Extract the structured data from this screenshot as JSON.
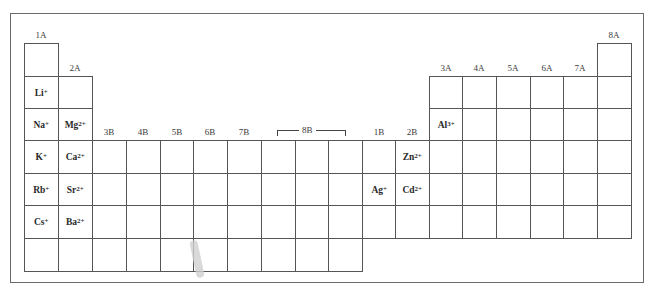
{
  "group_labels": {
    "g1": "1A",
    "g2": "2A",
    "g3": "3B",
    "g4": "4B",
    "g5": "5B",
    "g6": "6B",
    "g7": "7B",
    "g8": "8B",
    "g11": "1B",
    "g12": "2B",
    "g13": "3A",
    "g14": "4A",
    "g15": "5A",
    "g16": "6A",
    "g17": "7A",
    "g18": "8A"
  },
  "ions": {
    "li": {
      "symbol": "Li",
      "charge": "+"
    },
    "na": {
      "symbol": "Na",
      "charge": "+"
    },
    "k": {
      "symbol": "K",
      "charge": "+"
    },
    "rb": {
      "symbol": "Rb",
      "charge": "+"
    },
    "cs": {
      "symbol": "Cs",
      "charge": "+"
    },
    "mg": {
      "symbol": "Mg",
      "charge": "2+"
    },
    "ca": {
      "symbol": "Ca",
      "charge": "2+"
    },
    "sr": {
      "symbol": "Sr",
      "charge": "2+"
    },
    "ba": {
      "symbol": "Ba",
      "charge": "2+"
    },
    "al": {
      "symbol": "Al",
      "charge": "3+"
    },
    "zn": {
      "symbol": "Zn",
      "charge": "2+"
    },
    "cd": {
      "symbol": "Cd",
      "charge": "2+"
    },
    "ag": {
      "symbol": "Ag",
      "charge": "+"
    }
  }
}
